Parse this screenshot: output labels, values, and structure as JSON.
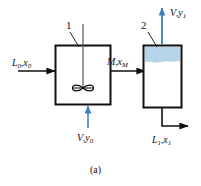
{
  "figure": {
    "caption": "(a)"
  },
  "equipment": [
    {
      "tag": "1",
      "name": "stirred-tank",
      "has_agitator": true
    },
    {
      "tag": "2",
      "name": "settling-vessel",
      "has_liquid_layer": true,
      "liquid_color": "#b6d5ea"
    }
  ],
  "streams": {
    "feed_liquid": {
      "name": "L0x0",
      "symbol": "L",
      "symbol_sub": "0",
      "composition": "x",
      "composition_sub": "0",
      "separator": ",",
      "color": "#111111",
      "direction": "right"
    },
    "feed_gas": {
      "name": "Vy0",
      "symbol": "V",
      "symbol_sub": "",
      "composition": "y",
      "composition_sub": "0",
      "separator": ",",
      "color": "#3f7fbf",
      "direction": "up"
    },
    "intermediate": {
      "name": "MxM",
      "symbol": "M",
      "symbol_sub": "",
      "composition": "x",
      "composition_sub": "M",
      "separator": ",",
      "color": "#111111",
      "direction": "right"
    },
    "product_gas": {
      "name": "Vy1",
      "symbol": "V",
      "symbol_sub": "",
      "composition": "y",
      "composition_sub": "1",
      "separator": ",",
      "color": "#3f7fbf",
      "direction": "up"
    },
    "product_liquid": {
      "name": "L1x1",
      "symbol": "L",
      "symbol_sub": "1",
      "composition": "x",
      "composition_sub": "1",
      "separator": ",",
      "color": "#111111",
      "direction": "right"
    }
  },
  "colors": {
    "line": "#111111",
    "blue_arrow": "#3f7fbf",
    "liquid_fill": "#b6d5ea",
    "background": "#ffffff"
  }
}
